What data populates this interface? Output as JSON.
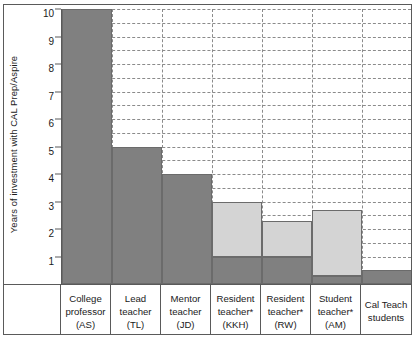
{
  "chart_data": {
    "type": "bar",
    "title": "",
    "subtitle": "",
    "xlabel": "",
    "ylabel": "Years of investment with CAL Prep/Aspire",
    "ylim": [
      0,
      10
    ],
    "ytick_labels": [
      "1",
      "2",
      "3",
      "4",
      "5",
      "6",
      "7",
      "8",
      "9",
      "10"
    ],
    "ytick_values": [
      1,
      2,
      3,
      4,
      5,
      6,
      7,
      8,
      9,
      10
    ],
    "grid": {
      "horizontal": true,
      "horizontal_interval": 0.5,
      "vertical": true,
      "style": "dashed"
    },
    "legend": {
      "visible": false,
      "position": "none"
    },
    "stacked": true,
    "categories": [
      "College professor (AS)",
      "Lead teacher (TL)",
      "Mentor teacher (JD)",
      "Resident teacher* (KKH)",
      "Resident teacher* (RW)",
      "Student teacher* (AM)",
      "Cal Teach students"
    ],
    "category_lines": [
      [
        "College",
        "professor",
        "(AS)"
      ],
      [
        "Lead",
        "teacher",
        "(TL)"
      ],
      [
        "Mentor",
        "teacher",
        "(JD)"
      ],
      [
        "Resident",
        "teacher*",
        "(KKH)"
      ],
      [
        "Resident",
        "teacher*",
        "(RW)"
      ],
      [
        "Student",
        "teacher*",
        "(AM)"
      ],
      [
        "Cal Teach",
        "students"
      ]
    ],
    "series": [
      {
        "name": "dark-segment",
        "color": "#808080",
        "values": [
          10,
          5,
          4,
          1,
          1,
          0.3,
          0.5
        ]
      },
      {
        "name": "light-segment",
        "color": "#d4d4d4",
        "values": [
          0,
          0,
          0,
          2,
          1.3,
          2.4,
          0
        ]
      }
    ],
    "totals": [
      10,
      5,
      4,
      3,
      2.3,
      2.7,
      0.5
    ],
    "colors": {
      "dark": "#808080",
      "light": "#d4d4d4",
      "bar_outline": "#6b6b6b",
      "axis": "#5a5a5a",
      "grid": "#8b8b8b",
      "text": "#1a1a1a",
      "background": "#ffffff"
    }
  }
}
